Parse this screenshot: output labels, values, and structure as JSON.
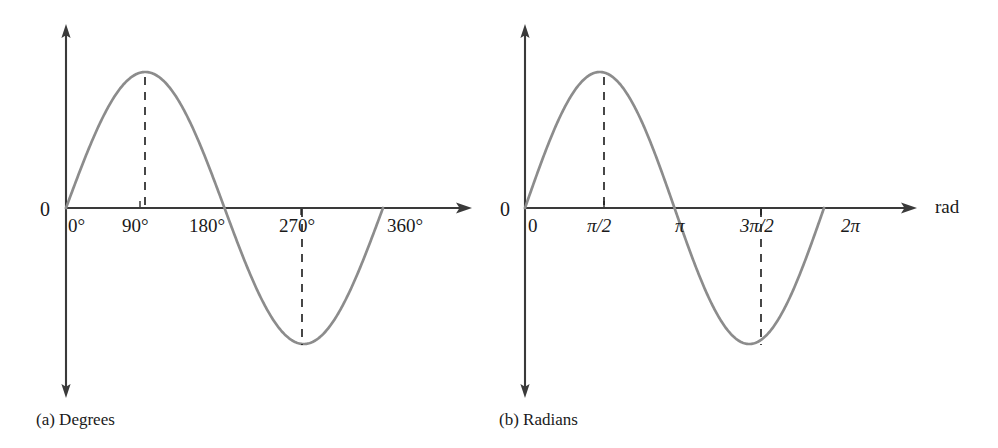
{
  "figure": {
    "background_color": "#ffffff",
    "curve_color": "#8c8c8c",
    "axis_color": "#3a3a3a",
    "text_color": "#1a1a1a"
  },
  "panels": [
    {
      "id": "degrees",
      "caption": "(a) Degrees",
      "origin_label": "0",
      "axis_unit_label": "",
      "ticks": [
        {
          "label": "0°",
          "value": 0
        },
        {
          "label": "90°",
          "value": 90
        },
        {
          "label": "180°",
          "value": 180
        },
        {
          "label": "270°",
          "value": 270
        },
        {
          "label": "360°",
          "value": 360
        }
      ],
      "dashed_guides": [
        {
          "at_label": "90°",
          "to": "peak"
        },
        {
          "at_label": "270°",
          "to": "trough"
        }
      ]
    },
    {
      "id": "radians",
      "caption": "(b) Radians",
      "origin_label": "0",
      "axis_unit_label": "rad",
      "ticks": [
        {
          "label": "0",
          "value": 0
        },
        {
          "label": "π/2",
          "value": 90
        },
        {
          "label": "π",
          "value": 180
        },
        {
          "label": "3π/2",
          "value": 270
        },
        {
          "label": "2π",
          "value": 360
        }
      ],
      "dashed_guides": [
        {
          "at_label": "π/2",
          "to": "peak"
        },
        {
          "at_label": "3π/2",
          "to": "trough"
        }
      ]
    }
  ],
  "chart_data": {
    "type": "line",
    "title": "",
    "xlabel": "",
    "ylabel": "",
    "function": "sin(x)",
    "series": [
      {
        "name": "sine wave",
        "x_degrees": [
          0,
          15,
          30,
          45,
          60,
          75,
          90,
          105,
          120,
          135,
          150,
          165,
          180,
          195,
          210,
          225,
          240,
          255,
          270,
          285,
          300,
          315,
          330,
          345,
          360
        ],
        "y": [
          0,
          0.259,
          0.5,
          0.707,
          0.866,
          0.966,
          1,
          0.966,
          0.866,
          0.707,
          0.5,
          0.259,
          0,
          -0.259,
          -0.5,
          -0.707,
          -0.866,
          -0.966,
          -1,
          -0.966,
          -0.866,
          -0.707,
          -0.5,
          -0.259,
          0
        ]
      }
    ],
    "xlim_degrees": [
      0,
      360
    ],
    "ylim": [
      -1,
      1
    ],
    "grid": false,
    "legend": "none",
    "annotations": [
      {
        "text": "peak at 90° (π/2), value 1"
      },
      {
        "text": "zero crossing at 180° (π)"
      },
      {
        "text": "trough at 270° (3π/2), value -1"
      },
      {
        "text": "zero crossing at 360° (2π)"
      }
    ]
  }
}
